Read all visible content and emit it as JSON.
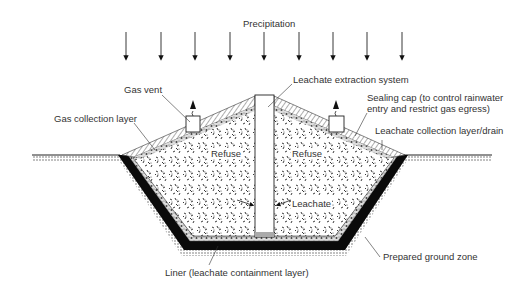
{
  "diagram": {
    "colors": {
      "line": "#222222",
      "liner": "#0a0a0a",
      "drain": "#9a9a9a",
      "text": "#333333",
      "background": "#ffffff"
    },
    "precipitation": {
      "label": "Precipitation",
      "arrow_x": [
        126,
        161,
        195,
        230,
        264,
        299,
        333,
        367,
        402
      ]
    },
    "labels": {
      "gas_vent": "Gas vent",
      "gas_collection_layer": "Gas collection layer",
      "leachate_extraction_system": "Leachate extraction system",
      "sealing_cap_line1": "Sealing cap (to control rainwater",
      "sealing_cap_line2": "entry and restrict gas egress)",
      "leachate_collection_layer": "Leachate collection layer/drain",
      "refuse_left": "Refuse",
      "refuse_right": "Refuse",
      "leachate": "Leachate",
      "liner": "Liner (leachate containment layer)",
      "prepared_ground_zone": "Prepared ground zone"
    }
  }
}
